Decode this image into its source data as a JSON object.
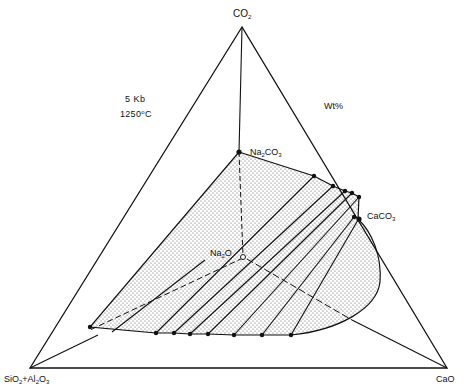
{
  "diagram": {
    "type": "ternary-phase-diagram",
    "vertices": {
      "top": {
        "base": "CO",
        "sub": "2"
      },
      "bottom_left": {
        "parts": [
          {
            "t": "SiO",
            "s": "2"
          },
          {
            "t": "+Al",
            "s": "2"
          },
          {
            "t": "O",
            "s": "3"
          }
        ]
      },
      "bottom_right": {
        "base": "CaO"
      }
    },
    "conditions": {
      "pressure": "5 Kb",
      "temperature_value": "1250",
      "temperature_unit": "C",
      "degree_symbol": "o"
    },
    "units_label": "Wt%",
    "points": {
      "na2co3": {
        "base": "Na",
        "s1": "2",
        "mid": "CO",
        "s2": "3"
      },
      "caco3": {
        "base": "CaCO",
        "s": "3"
      },
      "na2o": {
        "base": "Na",
        "s": "2",
        "tail": "O"
      }
    },
    "fill_pattern": "stippled",
    "colors": {
      "line": "#111111",
      "fill": "#ffffff",
      "stipple": "#555555"
    },
    "tie_line_count": 9
  }
}
